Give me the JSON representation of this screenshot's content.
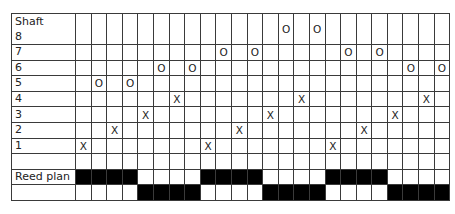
{
  "header_label": "Shaft",
  "columns": 24,
  "rows": [
    {
      "label": "8",
      "marks": {
        "14": "O",
        "16": "O"
      }
    },
    {
      "label": "7",
      "marks": {
        "10": "O",
        "12": "O",
        "18": "O",
        "20": "O"
      }
    },
    {
      "label": "6",
      "marks": {
        "6": "O",
        "8": "O",
        "22": "O",
        "24": "O"
      }
    },
    {
      "label": "5",
      "marks": {
        "2": "O",
        "4": "O"
      }
    },
    {
      "label": "4",
      "marks": {
        "7": "X",
        "15": "X",
        "23": "X"
      }
    },
    {
      "label": "3",
      "marks": {
        "5": "X",
        "13": "X",
        "21": "X"
      }
    },
    {
      "label": "2",
      "marks": {
        "3": "X",
        "11": "X",
        "19": "X"
      }
    },
    {
      "label": "1",
      "marks": {
        "1": "X",
        "9": "X",
        "17": "X"
      }
    },
    {
      "label": "",
      "marks": {}
    }
  ],
  "reed_plan": {
    "label": "Reed plan",
    "top_filled_columns": [
      1,
      2,
      3,
      4,
      9,
      10,
      11,
      12,
      17,
      18,
      19,
      20
    ],
    "bottom_filled_columns": [
      5,
      6,
      7,
      8,
      13,
      14,
      15,
      16,
      21,
      22,
      23,
      24
    ],
    "fill_color": "#000000"
  }
}
